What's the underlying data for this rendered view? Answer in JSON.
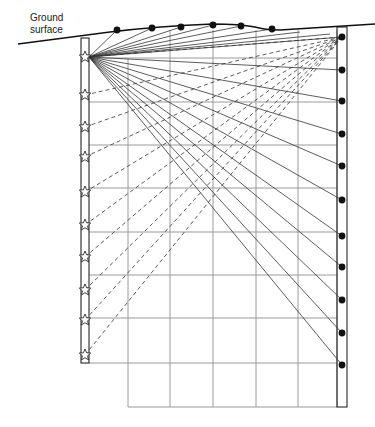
{
  "labels": {
    "ground_line1": "Ground",
    "ground_line2": "surface"
  },
  "colors": {
    "ink": "#111111",
    "grid": "#9a9a9a",
    "rays": "#333333"
  },
  "source": {
    "x": 89,
    "y": 57
  },
  "left_borehole": {
    "x1": 81,
    "x2": 89,
    "top": 38,
    "bottom": 363,
    "stars_y": [
      57,
      95,
      127,
      157,
      192,
      225,
      257,
      290,
      320,
      355
    ]
  },
  "right_borehole": {
    "x1": 337,
    "x2": 347,
    "top": 27,
    "bottom": 407,
    "receivers_y": [
      37,
      70,
      101,
      134,
      166,
      200,
      236,
      267,
      300,
      333,
      365
    ]
  },
  "surface_receivers": [
    [
      117,
      30
    ],
    [
      152,
      28
    ],
    [
      181,
      27
    ],
    [
      213,
      25
    ],
    [
      241,
      26
    ],
    [
      272,
      29
    ]
  ],
  "grid": {
    "xs": [
      128,
      170,
      213,
      256,
      298,
      337
    ],
    "ys": [
      102,
      145,
      188,
      232,
      275,
      318,
      363,
      407
    ],
    "left": 89,
    "right": 337
  }
}
